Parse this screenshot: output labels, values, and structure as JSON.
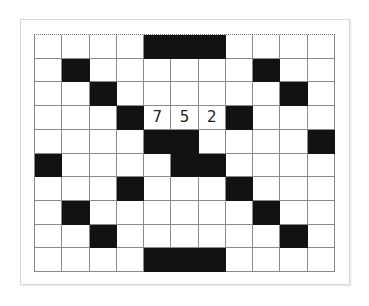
{
  "puzzle": {
    "rows": 10,
    "cols": 11,
    "colors": {
      "black": "#121212",
      "white": "#ffffff",
      "grid_line": "#8a8a8a"
    },
    "black_cells": [
      [
        0,
        4
      ],
      [
        0,
        5
      ],
      [
        0,
        6
      ],
      [
        1,
        1
      ],
      [
        1,
        8
      ],
      [
        2,
        2
      ],
      [
        2,
        9
      ],
      [
        3,
        3
      ],
      [
        3,
        7
      ],
      [
        4,
        4
      ],
      [
        4,
        5
      ],
      [
        4,
        10
      ],
      [
        5,
        0
      ],
      [
        5,
        5
      ],
      [
        5,
        6
      ],
      [
        6,
        3
      ],
      [
        6,
        7
      ],
      [
        7,
        1
      ],
      [
        7,
        8
      ],
      [
        8,
        2
      ],
      [
        8,
        9
      ],
      [
        9,
        4
      ],
      [
        9,
        5
      ],
      [
        9,
        6
      ]
    ],
    "numbers": [
      {
        "row": 3,
        "col": 4,
        "value": "7"
      },
      {
        "row": 3,
        "col": 5,
        "value": "5"
      },
      {
        "row": 3,
        "col": 6,
        "value": "2"
      }
    ]
  }
}
